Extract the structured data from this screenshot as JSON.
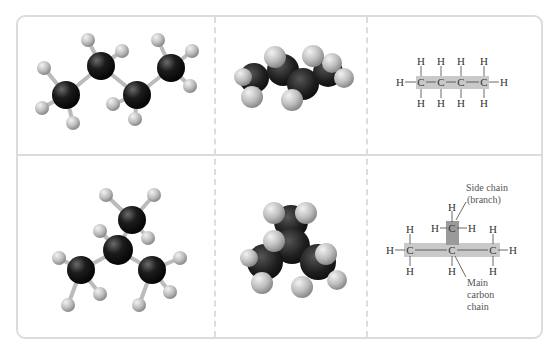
{
  "figure": {
    "rows": [
      {
        "name": "butane",
        "panels": [
          "ball-and-stick model",
          "space-filling model",
          "structural formula"
        ],
        "formula": {
          "atom_h": "H",
          "atom_c": "C"
        }
      },
      {
        "name": "isobutane",
        "panels": [
          "ball-and-stick model",
          "space-filling model",
          "structural formula"
        ],
        "formula": {
          "atom_h": "H",
          "atom_c": "C"
        },
        "labels": {
          "side_chain_line1": "Side chain",
          "side_chain_line2": "(branch)",
          "main_chain_line1": "Main",
          "main_chain_line2": "carbon",
          "main_chain_line3": "chain"
        }
      }
    ],
    "colors": {
      "carbon": "#1a1a1a",
      "hydrogen": "#c8c8c8",
      "main_chain_highlight": "#c9c9c9",
      "side_chain_highlight": "#9a9a9a",
      "border": "#dcdcdc"
    }
  }
}
